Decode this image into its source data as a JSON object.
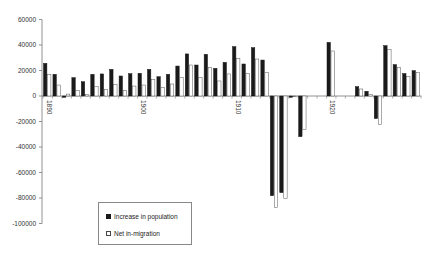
{
  "chart_data": {
    "type": "bar",
    "title": "",
    "xlabel": "",
    "ylabel": "",
    "ylim": [
      -100000,
      60000
    ],
    "yticks": [
      60000,
      40000,
      20000,
      0,
      -20000,
      -40000,
      -60000,
      -80000,
      -100000
    ],
    "xtick_labels": [
      "1890",
      "1900",
      "1910",
      "1920"
    ],
    "grid": false,
    "legend_position": "lower-left inside",
    "categories": [
      "1890",
      "1891",
      "1892",
      "1893",
      "1894",
      "1895",
      "1896",
      "1897",
      "1898",
      "1899",
      "1900",
      "1901",
      "1902",
      "1903",
      "1904",
      "1905",
      "1906",
      "1907",
      "1908",
      "1909",
      "1910",
      "1911",
      "1912",
      "1913",
      "1914",
      "1915",
      "1916",
      "1917",
      "1918",
      "1919",
      "1920",
      "1921",
      "1922",
      "1923",
      "1924",
      "1925",
      "1926",
      "1927",
      "1928",
      "1929"
    ],
    "series": [
      {
        "name": "Increase in population",
        "color": "#1a1a1a",
        "values": [
          25600,
          17000,
          -1000,
          14400,
          11200,
          17000,
          17300,
          20900,
          15700,
          17500,
          17800,
          20900,
          15100,
          17000,
          23500,
          33000,
          24300,
          32700,
          21700,
          26400,
          38700,
          25100,
          37900,
          28200,
          -78200,
          -75800,
          -1000,
          -31900,
          null,
          null,
          42100,
          null,
          null,
          7300,
          3700,
          -17700,
          39500,
          24600,
          17600,
          19900
        ]
      },
      {
        "name": "Net in-migration",
        "color": "#ffffff",
        "values": [
          17000,
          8600,
          1500,
          4200,
          1000,
          7300,
          5300,
          9200,
          4200,
          7800,
          8600,
          13100,
          6800,
          9400,
          14700,
          24300,
          14700,
          22500,
          11800,
          17300,
          29600,
          17800,
          29000,
          18600,
          -87300,
          -80200,
          -500,
          -26100,
          null,
          null,
          35300,
          null,
          null,
          5500,
          1000,
          -22400,
          36400,
          22300,
          15100,
          18600
        ]
      }
    ]
  },
  "legend": {
    "items": [
      {
        "label": "Increase in population",
        "swatch": "filled-black"
      },
      {
        "label": "Net in-migration",
        "swatch": "hollow-white"
      }
    ]
  }
}
